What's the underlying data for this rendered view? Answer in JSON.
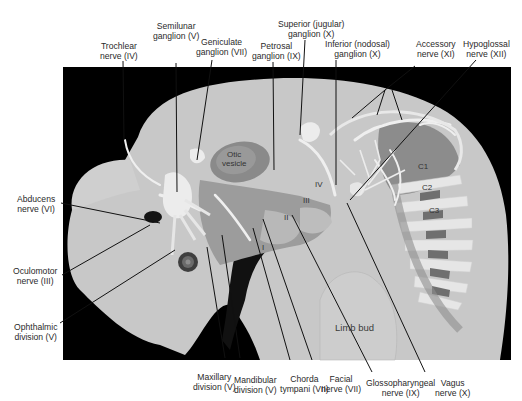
{
  "figure": {
    "colors": {
      "background_panel": "#000000",
      "embryo_body": "#c9c9c9",
      "nerve": "#efefef",
      "tissue_dark": "#7a7a7a",
      "leader_line": "#111111",
      "label_text": "#2a2a2a"
    },
    "top_labels": [
      {
        "id": "trochlear",
        "line1": "Trochlear",
        "line2": "nerve (IV)"
      },
      {
        "id": "semilunar",
        "line1": "Semilunar",
        "line2": "ganglion (V)"
      },
      {
        "id": "geniculate",
        "line1": "Geniculate",
        "line2": "ganglion (VII)"
      },
      {
        "id": "petrosal",
        "line1": "Petrosal",
        "line2": "ganglion (IX)"
      },
      {
        "id": "superior",
        "line1": "Superior (jugular)",
        "line2": "ganglion (X)"
      },
      {
        "id": "inferior",
        "line1": "Inferior (nodosal)",
        "line2": "ganglion (X)"
      },
      {
        "id": "accessory",
        "line1": "Accessory",
        "line2": "nerve (XI)"
      },
      {
        "id": "hypoglossal",
        "line1": "Hypoglossal",
        "line2": "nerve (XII)"
      }
    ],
    "left_labels": [
      {
        "id": "abducens",
        "line1": "Abducens",
        "line2": "nerve (VI)"
      },
      {
        "id": "oculomotor",
        "line1": "Oculomotor",
        "line2": "nerve (III)"
      },
      {
        "id": "ophthalmic",
        "line1": "Ophthalmic",
        "line2": "division (V)"
      }
    ],
    "bottom_labels": [
      {
        "id": "maxillary",
        "line1": "Maxillary",
        "line2": "division (V)"
      },
      {
        "id": "mandibular",
        "line1": "Mandibular",
        "line2": "division (V)"
      },
      {
        "id": "chorda",
        "line1": "Chorda",
        "line2": "tympani (VII)"
      },
      {
        "id": "facial",
        "line1": "Facial",
        "line2": "nerve (VII)"
      },
      {
        "id": "glossopharyngeal",
        "line1": "Glossopharyngeal",
        "line2": "nerve (IX)"
      },
      {
        "id": "vagus",
        "line1": "Vagus",
        "line2": "nerve (X)"
      }
    ],
    "inner_labels": {
      "otic_line1": "Otic",
      "otic_line2": "vesicle",
      "arch_1": "I",
      "arch_2": "II",
      "arch_3": "III",
      "arch_4": "IV",
      "c1": "C1",
      "c2": "C2",
      "c3": "C3",
      "limb_bud": "Limb bud"
    }
  }
}
